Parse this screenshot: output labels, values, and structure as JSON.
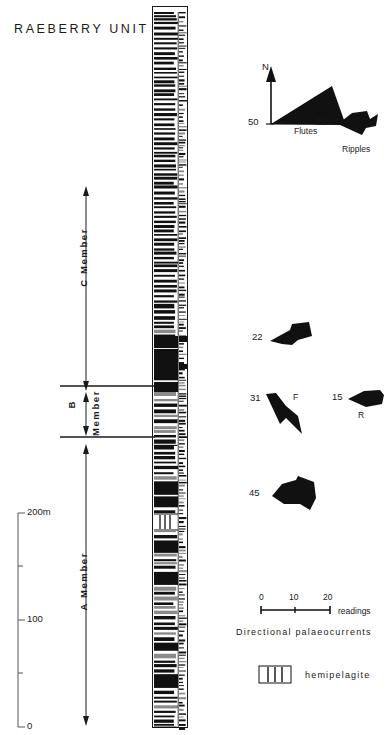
{
  "title": "RAEBERRY  UNIT",
  "members": [
    {
      "id": "C",
      "label": "C  Member",
      "top": 190,
      "bottom": 387
    },
    {
      "id": "B",
      "label": "B",
      "label2": "Member",
      "top": 389,
      "bottom": 440
    },
    {
      "id": "A",
      "label": "A  Member",
      "top": 525,
      "bottom": 728
    }
  ],
  "depth_scale": {
    "unit": "m",
    "ticks": [
      {
        "label": "200m",
        "y": 513,
        "major": true
      },
      {
        "label": "",
        "y": 566,
        "major": false
      },
      {
        "label": "100",
        "y": 620,
        "major": true
      },
      {
        "label": "",
        "y": 673,
        "major": false
      },
      {
        "label": "0",
        "y": 727,
        "major": true
      }
    ]
  },
  "rose_diagrams": [
    {
      "name": "flutes-top",
      "count": "50",
      "label": "Flutes",
      "north_label": "N",
      "cx": 262,
      "cy": 124
    },
    {
      "name": "ripples-top",
      "count": "22",
      "label": "Ripples",
      "cx": 345,
      "cy": 124
    },
    {
      "name": "rose-mid-22",
      "count": "22",
      "label": "",
      "cx": 272,
      "cy": 338
    },
    {
      "name": "flutes-mid",
      "count": "31",
      "label": "F",
      "cx": 266,
      "cy": 402
    },
    {
      "name": "ripples-mid",
      "count": "15",
      "label": "R",
      "cx": 381,
      "cy": 398
    },
    {
      "name": "rose-low-45",
      "count": "45",
      "label": "",
      "cx": 274,
      "cy": 494
    }
  ],
  "readings_scale": {
    "ticks": [
      "0",
      "10",
      "20"
    ],
    "unit_label": "readings",
    "caption": "Directional  palaeocurrents"
  },
  "legend": {
    "hemipelagite_label": "hemipelagite"
  },
  "colors": {
    "ink": "#111111",
    "gray": "#8a8a8a",
    "paper": "#ffffff"
  }
}
